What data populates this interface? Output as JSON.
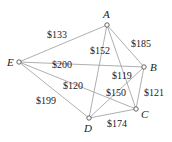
{
  "graph": {
    "nodes": [
      {
        "id": "A",
        "label": "A",
        "x": 107,
        "y": 25,
        "lx": 103,
        "ly": 18
      },
      {
        "id": "B",
        "label": "B",
        "x": 144,
        "y": 67,
        "lx": 150,
        "ly": 71
      },
      {
        "id": "C",
        "label": "C",
        "x": 136,
        "y": 109,
        "lx": 141,
        "ly": 118
      },
      {
        "id": "D",
        "label": "D",
        "x": 89,
        "y": 118,
        "lx": 84,
        "ly": 132
      },
      {
        "id": "E",
        "label": "E",
        "x": 19,
        "y": 62,
        "lx": 7,
        "ly": 66
      }
    ],
    "edges": [
      {
        "from": "E",
        "to": "A",
        "label": "$133",
        "lx": 47,
        "ly": 38
      },
      {
        "from": "A",
        "to": "B",
        "label": "$185",
        "lx": 131,
        "ly": 47
      },
      {
        "from": "E",
        "to": "B",
        "label": "$200",
        "lx": 52,
        "ly": 68
      },
      {
        "from": "A",
        "to": "D",
        "label": "$152",
        "lx": 90,
        "ly": 54
      },
      {
        "from": "A",
        "to": "C",
        "label": "$119",
        "lx": 112,
        "ly": 79
      },
      {
        "from": "E",
        "to": "C",
        "label": "$120",
        "lx": 63,
        "ly": 89
      },
      {
        "from": "E",
        "to": "D",
        "label": "$199",
        "lx": 36,
        "ly": 104
      },
      {
        "from": "D",
        "to": "B",
        "label": "$150",
        "lx": 106,
        "ly": 96
      },
      {
        "from": "B",
        "to": "C",
        "label": "$121",
        "lx": 144,
        "ly": 96
      },
      {
        "from": "D",
        "to": "C",
        "label": "$174",
        "lx": 107,
        "ly": 127
      }
    ]
  }
}
